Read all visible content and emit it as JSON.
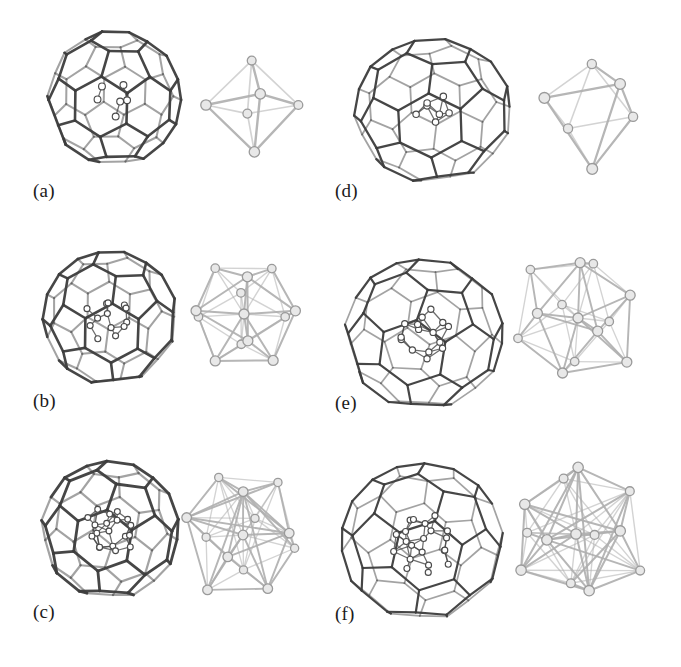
{
  "figure": {
    "background": "#ffffff",
    "width": 681,
    "height": 667,
    "cage_color": "#595959",
    "cage_color_dark": "#3d3d3d",
    "cluster_color": "#b0b0b0",
    "cluster_node_fill": "#e8e8e8",
    "cluster_node_stroke": "#9a9a9a",
    "atom_fill": "#ffffff",
    "atom_stroke": "#4a4a4a"
  },
  "panels": [
    {
      "id": "a",
      "label": "(a)",
      "label_x": 33,
      "label_y": 180,
      "cage": {
        "name": "fullerene-cage-a",
        "x": 38,
        "y": 22,
        "size": 152,
        "type": "truncated-icosahedron",
        "rot_x": -8,
        "rot_y": 10,
        "rot_z": 0,
        "squash": 1.0,
        "stroke_width": 2.6
      },
      "cluster": {
        "name": "metal-cluster-a",
        "x": 200,
        "y": 52,
        "size": 106,
        "type": "octahedron",
        "vertices": 6,
        "rot_x": 12,
        "rot_y": 8,
        "rot_z": 0,
        "node_radius": 5.2,
        "stroke_width": 2.4
      },
      "inner_atoms": {
        "name": "encapsulated-atoms-a",
        "x": 38,
        "y": 22,
        "size": 152,
        "count": 6,
        "radius": 3.4,
        "spread": 0.3
      }
    },
    {
      "id": "b",
      "label": "(b)",
      "label_x": 33,
      "label_y": 390,
      "cage": {
        "name": "fullerene-cage-b",
        "x": 34,
        "y": 242,
        "size": 152,
        "type": "truncated-icosahedron",
        "rot_x": -14,
        "rot_y": 22,
        "rot_z": -4,
        "squash": 1.0,
        "stroke_width": 2.6
      },
      "cluster": {
        "name": "metal-cluster-b",
        "x": 182,
        "y": 252,
        "size": 124,
        "type": "icosahedron",
        "vertices": 13,
        "rot_x": 6,
        "rot_y": 4,
        "rot_z": 0,
        "node_radius": 5.0,
        "stroke_width": 2.0
      },
      "inner_atoms": {
        "name": "encapsulated-atoms-b",
        "x": 34,
        "y": 242,
        "size": 152,
        "count": 13,
        "radius": 3.0,
        "spread": 0.36
      }
    },
    {
      "id": "c",
      "label": "(c)",
      "label_x": 33,
      "label_y": 601,
      "cage": {
        "name": "fullerene-cage-c",
        "x": 32,
        "y": 452,
        "size": 156,
        "type": "truncated-icosahedron",
        "rot_x": -10,
        "rot_y": 16,
        "rot_z": 6,
        "squash": 1.0,
        "stroke_width": 2.8
      },
      "cluster": {
        "name": "metal-cluster-c",
        "x": 178,
        "y": 470,
        "size": 130,
        "type": "icosahedron-centered",
        "vertices": 19,
        "rot_x": 14,
        "rot_y": -10,
        "rot_z": 8,
        "node_radius": 4.8,
        "stroke_width": 1.9
      },
      "inner_atoms": {
        "name": "encapsulated-atoms-c",
        "x": 32,
        "y": 452,
        "size": 156,
        "count": 19,
        "radius": 2.9,
        "spread": 0.4
      }
    },
    {
      "id": "d",
      "label": "(d)",
      "label_x": 335,
      "label_y": 180,
      "cage": {
        "name": "fullerene-cage-d",
        "x": 344,
        "y": 22,
        "size": 178,
        "type": "elongated-fullerene",
        "rot_x": -12,
        "rot_y": 18,
        "rot_z": -6,
        "squash": 0.92,
        "stroke_width": 2.3
      },
      "cluster": {
        "name": "metal-cluster-d",
        "x": 532,
        "y": 48,
        "size": 120,
        "type": "octahedron-tilted",
        "vertices": 7,
        "rot_x": 28,
        "rot_y": 24,
        "rot_z": 12,
        "node_radius": 5.4,
        "stroke_width": 2.2
      },
      "inner_atoms": {
        "name": "encapsulated-atoms-d",
        "x": 344,
        "y": 22,
        "size": 178,
        "count": 7,
        "radius": 3.2,
        "spread": 0.26
      }
    },
    {
      "id": "e",
      "label": "(e)",
      "label_x": 335,
      "label_y": 392,
      "cage": {
        "name": "fullerene-cage-e",
        "x": 334,
        "y": 244,
        "size": 180,
        "type": "elongated-fullerene",
        "rot_x": -16,
        "rot_y": 14,
        "rot_z": 4,
        "squash": 0.95,
        "stroke_width": 2.2
      },
      "cluster": {
        "name": "metal-cluster-e",
        "x": 512,
        "y": 252,
        "size": 132,
        "type": "icosahedron-distorted",
        "vertices": 15,
        "rot_x": 20,
        "rot_y": 16,
        "rot_z": -10,
        "node_radius": 5.0,
        "stroke_width": 1.9
      },
      "inner_atoms": {
        "name": "encapsulated-atoms-e",
        "x": 334,
        "y": 244,
        "size": 180,
        "count": 15,
        "radius": 3.1,
        "spread": 0.34
      }
    },
    {
      "id": "f",
      "label": "(f)",
      "label_x": 335,
      "label_y": 603,
      "cage": {
        "name": "fullerene-cage-f",
        "x": 330,
        "y": 450,
        "size": 184,
        "type": "elongated-fullerene",
        "rot_x": -10,
        "rot_y": 26,
        "rot_z": 8,
        "squash": 0.97,
        "stroke_width": 2.2
      },
      "cluster": {
        "name": "metal-cluster-f",
        "x": 500,
        "y": 458,
        "size": 152,
        "type": "icosahedron-centered",
        "vertices": 21,
        "rot_x": 26,
        "rot_y": -18,
        "rot_z": 16,
        "node_radius": 5.2,
        "stroke_width": 2.0
      },
      "inner_atoms": {
        "name": "encapsulated-atoms-f",
        "x": 330,
        "y": 450,
        "size": 184,
        "count": 21,
        "radius": 3.0,
        "spread": 0.38
      }
    }
  ]
}
